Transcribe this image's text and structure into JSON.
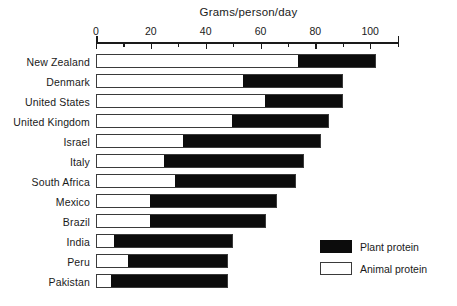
{
  "chart_data": {
    "type": "bar",
    "orientation": "horizontal",
    "stacked": true,
    "title": "Grams/person/day",
    "xlabel": "Grams/person/day",
    "ylabel": "",
    "xlim": [
      0,
      110
    ],
    "grid": false,
    "legend_position": "bottom-right",
    "x_ticks_major": [
      0,
      20,
      40,
      60,
      80,
      100
    ],
    "x_tick_labels": [
      "0",
      "20",
      "40",
      "60",
      "80",
      "100"
    ],
    "x_ticks_minor": [
      10,
      30,
      50,
      70,
      90,
      110
    ],
    "categories": [
      "New Zealand",
      "Denmark",
      "United States",
      "United Kingdom",
      "Israel",
      "Italy",
      "South Africa",
      "Mexico",
      "Brazil",
      "India",
      "Peru",
      "Pakistan"
    ],
    "series": [
      {
        "name": "Animal protein",
        "color": "#ffffff",
        "values": [
          74,
          54,
          62,
          50,
          32,
          25,
          29,
          20,
          20,
          7,
          12,
          6
        ]
      },
      {
        "name": "Plant protein",
        "color": "#0c0c0c",
        "values": [
          28,
          36,
          28,
          35,
          50,
          51,
          44,
          46,
          42,
          43,
          36,
          42
        ]
      }
    ],
    "totals": [
      102,
      90,
      90,
      85,
      82,
      76,
      73,
      66,
      62,
      50,
      48,
      48
    ]
  },
  "legend": {
    "items": [
      {
        "label": "Plant protein",
        "swatch": "plant"
      },
      {
        "label": "Animal protein",
        "swatch": "animal"
      }
    ]
  }
}
